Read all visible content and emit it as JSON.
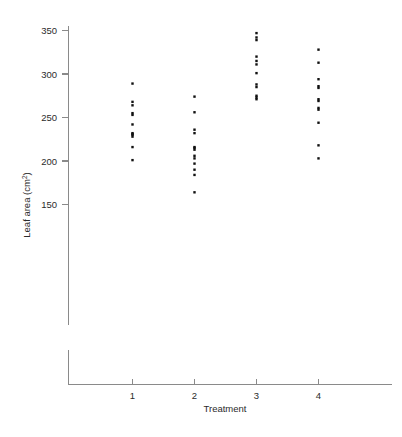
{
  "chart_data": {
    "type": "scatter",
    "title": "",
    "xlabel": "Treatment",
    "ylabel": "Leaf area (cm2)",
    "ylabel_base": "Leaf area (cm",
    "ylabel_sup": "2",
    "ylabel_tail": ")",
    "x_categories": [
      "1",
      "2",
      "3",
      "4"
    ],
    "x_tick_labels": [
      "1",
      "2",
      "3",
      "4"
    ],
    "y_tick_labels": [
      "150",
      "200",
      "250",
      "300",
      "350"
    ],
    "y_tick_values": [
      150,
      200,
      250,
      300,
      350
    ],
    "ylim": [
      140,
      352
    ],
    "xlim": [
      0.4,
      4.75
    ],
    "grid": false,
    "legend": null,
    "axis_break": true,
    "marker": "square",
    "marker_color": "#111111",
    "axis_color": "#8a8a8a",
    "series": [
      {
        "name": "Treatment 1",
        "x": 1,
        "values": [
          289,
          268,
          264,
          255,
          253,
          242,
          232,
          231,
          230,
          228,
          216,
          201
        ]
      },
      {
        "name": "Treatment 2",
        "x": 2,
        "values": [
          274,
          256,
          236,
          232,
          216,
          215,
          213,
          206,
          203,
          197,
          190,
          184,
          164
        ]
      },
      {
        "name": "Treatment 3",
        "x": 3,
        "values": [
          347,
          342,
          339,
          320,
          315,
          311,
          301,
          288,
          285,
          275,
          273,
          271
        ]
      },
      {
        "name": "Treatment 4",
        "x": 4,
        "values": [
          328,
          313,
          294,
          286,
          284,
          271,
          269,
          261,
          259,
          244,
          218,
          203
        ]
      }
    ]
  },
  "figure": {
    "background_color": "#ffffff"
  }
}
